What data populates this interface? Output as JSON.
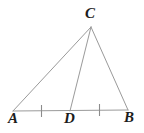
{
  "figure": {
    "background_color": "#ffffff",
    "stroke_color": "#9a9a9a",
    "tick_color": "#8c8c8c",
    "label_color": "#1c1c1c",
    "stroke_width": 1,
    "canvas": {
      "width": 144,
      "height": 133
    }
  },
  "labels": {
    "apex": "C",
    "left_base": "A",
    "midpoint": "D",
    "right_base": "B"
  },
  "points": {
    "C": {
      "x": 91,
      "y": 27
    },
    "A": {
      "x": 13,
      "y": 111
    },
    "D": {
      "x": 70,
      "y": 111
    },
    "B": {
      "x": 128,
      "y": 110
    }
  },
  "segments": [
    {
      "name": "AC",
      "from": "A",
      "to": "C"
    },
    {
      "name": "CB",
      "from": "C",
      "to": "B"
    },
    {
      "name": "AB",
      "from": "A",
      "to": "B"
    },
    {
      "name": "CD",
      "from": "C",
      "to": "D"
    }
  ],
  "tick_marks": [
    {
      "name": "tick-AD",
      "segment": "AD",
      "x": 41.5,
      "y_top": 105,
      "y_bottom": 117,
      "count": 1
    },
    {
      "name": "tick-DB",
      "segment": "DB",
      "x": 99.5,
      "y_top": 104,
      "y_bottom": 116,
      "count": 1
    }
  ]
}
